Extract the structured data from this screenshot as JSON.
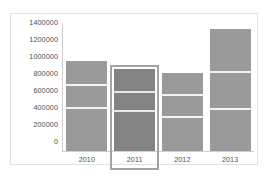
{
  "chart_data": {
    "type": "bar",
    "title": "",
    "xlabel": "",
    "ylabel": "",
    "categories": [
      "2010",
      "2011",
      "2012",
      "2013"
    ],
    "values": [
      1060000,
      960000,
      920000,
      1430000
    ],
    "ylim": [
      0,
      1400000
    ],
    "y_ticks": [
      0,
      200000,
      400000,
      600000,
      800000,
      1000000,
      1200000,
      1400000
    ],
    "y_tick_labels": [
      "0",
      "200000",
      "400000",
      "600000",
      "800000",
      "1000000",
      "1200000",
      "1400000"
    ],
    "grid": false,
    "legend": "none",
    "stacked": true,
    "series": [
      {
        "name": "segment-1",
        "values": [
          490000,
          460000,
          390000,
          480000
        ]
      },
      {
        "name": "segment-2",
        "values": [
          280000,
          220000,
          260000,
          440000
        ]
      },
      {
        "name": "segment-3",
        "values": [
          290000,
          280000,
          270000,
          510000
        ]
      }
    ],
    "segment_boundaries": [
      [
        490000,
        770000
      ],
      [
        460000,
        680000
      ],
      [
        390000,
        650000
      ],
      [
        480000,
        920000
      ]
    ],
    "selected_category": "2011",
    "colors": {
      "bar": "#9a9a9a",
      "bar_selected": "#838383",
      "divider": "#f2f2f2",
      "selection_ring": "#a3a3a3",
      "axis": "#cfcfcf",
      "text": "#4d4d4d",
      "frame": "#e2e2e2",
      "background": "#ffffff"
    }
  }
}
